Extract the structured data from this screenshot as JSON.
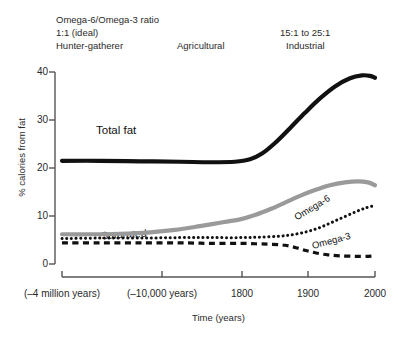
{
  "chart_data": {
    "type": "line",
    "title": "",
    "xlabel": "Time (years)",
    "ylabel": "% calories from fat",
    "ylim": [
      0,
      40
    ],
    "yticks": [
      0,
      10,
      20,
      30,
      40
    ],
    "grid": false,
    "legend_position": "inline-labels",
    "x_tick_labels": [
      "(–4 million years)",
      "(–10,000 years)",
      "1800",
      "1900",
      "2000"
    ],
    "x_tick_positions_px": [
      62,
      162,
      242,
      308,
      375
    ],
    "annotations": [
      {
        "name": "ratio-title",
        "text": "Omega-6/Omega-3 ratio"
      },
      {
        "name": "ratio-ideal",
        "text": "1:1 (ideal)"
      },
      {
        "name": "era-hunter-gatherer",
        "text": "Hunter-gatherer"
      },
      {
        "name": "era-agricultural",
        "text": "Agricultural"
      },
      {
        "name": "ratio-industrial",
        "text": "15:1 to 25:1"
      },
      {
        "name": "era-industrial",
        "text": "Industrial"
      }
    ],
    "series": [
      {
        "name": "Total fat",
        "color": "#111111",
        "style": "solid",
        "width": 4.2,
        "points": [
          [
            62,
            21.5
          ],
          [
            100,
            21.5
          ],
          [
            140,
            21.4
          ],
          [
            180,
            21.3
          ],
          [
            210,
            21.2
          ],
          [
            235,
            21.3
          ],
          [
            250,
            21.8
          ],
          [
            262,
            23.0
          ],
          [
            275,
            25.2
          ],
          [
            290,
            28.3
          ],
          [
            305,
            31.5
          ],
          [
            320,
            34.5
          ],
          [
            335,
            37.0
          ],
          [
            350,
            38.7
          ],
          [
            362,
            39.3
          ],
          [
            370,
            39.2
          ],
          [
            375,
            38.8
          ]
        ]
      },
      {
        "name": "Saturated",
        "color": "#9a9a9a",
        "style": "solid",
        "width": 4.2,
        "points": [
          [
            62,
            6.2
          ],
          [
            90,
            6.2
          ],
          [
            120,
            6.3
          ],
          [
            150,
            6.6
          ],
          [
            175,
            7.1
          ],
          [
            200,
            7.9
          ],
          [
            220,
            8.6
          ],
          [
            240,
            9.3
          ],
          [
            255,
            10.2
          ],
          [
            270,
            11.4
          ],
          [
            285,
            12.8
          ],
          [
            300,
            14.2
          ],
          [
            315,
            15.4
          ],
          [
            330,
            16.4
          ],
          [
            345,
            17.0
          ],
          [
            358,
            17.2
          ],
          [
            368,
            17.0
          ],
          [
            375,
            16.4
          ]
        ]
      },
      {
        "name": "Omega-6",
        "color": "#111111",
        "style": "dotted",
        "width": 3.0,
        "points": [
          [
            62,
            5.3
          ],
          [
            100,
            5.4
          ],
          [
            140,
            5.4
          ],
          [
            180,
            5.5
          ],
          [
            210,
            5.5
          ],
          [
            240,
            5.5
          ],
          [
            260,
            5.6
          ],
          [
            280,
            5.8
          ],
          [
            295,
            6.2
          ],
          [
            308,
            6.8
          ],
          [
            320,
            7.6
          ],
          [
            332,
            8.7
          ],
          [
            344,
            9.8
          ],
          [
            356,
            10.9
          ],
          [
            366,
            11.7
          ],
          [
            375,
            12.2
          ]
        ]
      },
      {
        "name": "Omega-3",
        "color": "#111111",
        "style": "dashed",
        "width": 3.2,
        "points": [
          [
            62,
            4.4
          ],
          [
            100,
            4.4
          ],
          [
            140,
            4.4
          ],
          [
            180,
            4.4
          ],
          [
            210,
            4.3
          ],
          [
            240,
            4.3
          ],
          [
            258,
            4.2
          ],
          [
            272,
            4.1
          ],
          [
            285,
            3.9
          ],
          [
            296,
            3.4
          ],
          [
            306,
            2.8
          ],
          [
            316,
            2.3
          ],
          [
            328,
            1.9
          ],
          [
            340,
            1.7
          ],
          [
            355,
            1.6
          ],
          [
            368,
            1.6
          ],
          [
            375,
            1.7
          ]
        ]
      }
    ]
  },
  "axes": {
    "ytick_labels": [
      "40",
      "30",
      "20",
      "10",
      "0"
    ],
    "xtick_labels": [
      "(–4 million years)",
      "(–10,000 years)",
      "1800",
      "1900",
      "2000"
    ],
    "ylabel": "% calories from fat",
    "xlabel": "Time (years)"
  },
  "eras": {
    "ratio_title": "Omega-6/Omega-3 ratio",
    "ratio_ideal": "1:1 (ideal)",
    "hunter_gatherer": "Hunter-gatherer",
    "agricultural": "Agricultural",
    "ratio_industrial": "15:1 to 25:1",
    "industrial": "Industrial"
  },
  "series_labels": {
    "total_fat": "Total fat",
    "saturated": "Saturated",
    "omega6": "Omega-6",
    "omega3": "Omega-3"
  },
  "colors": {
    "total_fat": "#111111",
    "saturated": "#9a9a9a",
    "omega": "#111111",
    "axis": "#555555",
    "text": "#2a2a2a"
  }
}
